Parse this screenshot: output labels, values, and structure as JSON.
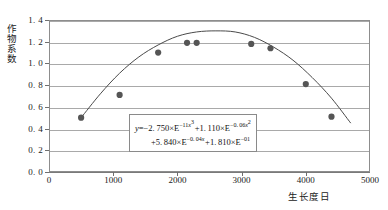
{
  "chart_data": {
    "type": "scatter",
    "title": "",
    "xlabel": "生长度日",
    "ylabel": "作物系数",
    "xlim": [
      0,
      5000
    ],
    "ylim": [
      0.0,
      1.4
    ],
    "grid": true,
    "legend": "none",
    "x_ticks": [
      "0",
      "1000",
      "2000",
      "3000",
      "4000",
      "5000"
    ],
    "x_tick_values": [
      0,
      1000,
      2000,
      3000,
      4000,
      5000
    ],
    "y_ticks": [
      "0. 0",
      "0. 2",
      "0. 4",
      "0. 6",
      "0. 8",
      "1. 0",
      "1. 2",
      "1. 4"
    ],
    "y_tick_values": [
      0.0,
      0.2,
      0.4,
      0.6,
      0.8,
      1.0,
      1.2,
      1.4
    ],
    "points": [
      {
        "x": 500,
        "y": 0.5
      },
      {
        "x": 1100,
        "y": 0.71
      },
      {
        "x": 1700,
        "y": 1.1
      },
      {
        "x": 2150,
        "y": 1.19
      },
      {
        "x": 2300,
        "y": 1.19
      },
      {
        "x": 3150,
        "y": 1.18
      },
      {
        "x": 3450,
        "y": 1.14
      },
      {
        "x": 4000,
        "y": 0.81
      },
      {
        "x": 4400,
        "y": 0.51
      }
    ],
    "series": [
      {
        "name": "观测值",
        "type": "scatter",
        "x": [
          500,
          1100,
          1700,
          2150,
          2300,
          3150,
          3450,
          4000,
          4400
        ],
        "values": [
          0.5,
          0.71,
          1.1,
          1.19,
          1.19,
          1.18,
          1.14,
          0.81,
          0.51
        ]
      },
      {
        "name": "拟合曲线",
        "type": "line",
        "x": [
          500,
          800,
          1100,
          1400,
          1700,
          2000,
          2300,
          2600,
          2900,
          3200,
          3500,
          3800,
          4100,
          4400,
          4700
        ],
        "values": [
          0.5,
          0.72,
          0.91,
          1.06,
          1.17,
          1.25,
          1.29,
          1.3,
          1.29,
          1.24,
          1.15,
          1.03,
          0.87,
          0.68,
          0.45
        ]
      }
    ],
    "annotation": {
      "equation_line1": "y=−2. 750×E−11x3 +1. 110×E−0. 06x2",
      "equation_line2": "+5. 840×E−0. 04x +1. 810×E−01",
      "equation_terms": [
        {
          "coefficient": "2. 750",
          "sign": "−",
          "base": "E",
          "exponent": "−11",
          "variable": "x",
          "power": "3"
        },
        {
          "coefficient": "1. 110",
          "sign": "+",
          "base": "E",
          "exponent": "−0. 06",
          "variable": "x",
          "power": "2"
        },
        {
          "coefficient": "5. 840",
          "sign": "+",
          "base": "E",
          "exponent": "−0. 04",
          "variable": "x",
          "power": "1"
        },
        {
          "coefficient": "1. 810",
          "sign": "+",
          "base": "E",
          "exponent": "−01",
          "variable": "",
          "power": ""
        }
      ]
    },
    "colors": {
      "marker": "#555555",
      "curve": "#4a4a4a",
      "grid": "#a9a9a9",
      "frame": "#8d8d8d",
      "text": "#1a1a1a"
    }
  }
}
